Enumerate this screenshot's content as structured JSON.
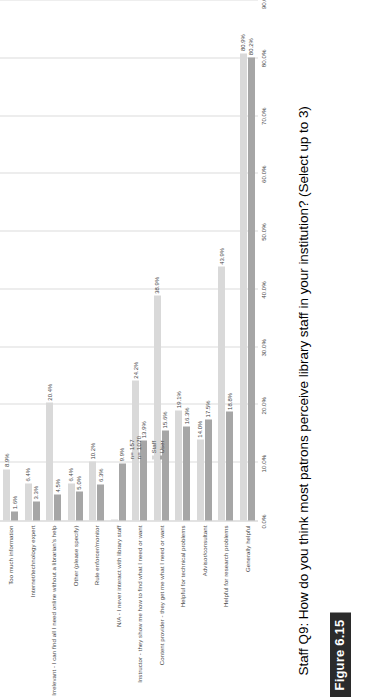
{
  "figure": {
    "badge_label": "Figure 6.15",
    "title": "Staff Q9: How do you think most patrons perceive library staff in your institution? (Select up to 3)"
  },
  "annotations": {
    "n_staff": "n= 157",
    "n_user": "n= 1070"
  },
  "colors": {
    "staff": "#d9d9d9",
    "user": "#a6a6a6",
    "grid": "#dcdcdc",
    "axis": "#c7c7c7",
    "text": "#4a4a4a",
    "badge_bg": "#2b2b2b"
  },
  "chart_data": {
    "type": "bar",
    "orientation": "vertical",
    "title": "Staff Q9: How do you think most patrons perceive library staff in your institution? (Select up to 3)",
    "xlabel": "",
    "ylabel": "",
    "ylim": [
      0,
      90
    ],
    "ytick_labels": [
      "0.0%",
      "10.0%",
      "20.0%",
      "30.0%",
      "40.0%",
      "50.0%",
      "60.0%",
      "70.0%",
      "80.0%",
      "90.0%"
    ],
    "ytick_values": [
      0,
      10,
      20,
      30,
      40,
      50,
      60,
      70,
      80,
      90
    ],
    "grid": true,
    "legend_position": "upper-right-inside",
    "categories": [
      "Too much information",
      "Internet/technology expert",
      "Irrelevant - I can find all I need online without a librarian's help",
      "Other (please specify)",
      "Rule enforcer/monitor",
      "N/A - I never interact with library staff",
      "Instructor - they show me how to find what I need or want",
      "Content provider - they get me what I need or want",
      "Helpful for technical problems",
      "Advisor/consultant",
      "Helpful for research problems",
      "Generally helpful"
    ],
    "series": [
      {
        "name": "Staff",
        "color": "#d9d9d9",
        "values": [
          8.9,
          6.4,
          20.4,
          6.4,
          10.2,
          0.0,
          24.2,
          38.9,
          19.1,
          14.0,
          43.9,
          80.9
        ],
        "labels": [
          "8.9%",
          "6.4%",
          "20.4%",
          "6.4%",
          "10.2%",
          "",
          "24.2%",
          "38.9%",
          "19.1%",
          "14.0%",
          "43.9%",
          "80.9%"
        ]
      },
      {
        "name": "User",
        "color": "#a6a6a6",
        "values": [
          1.6,
          3.3,
          4.5,
          5.0,
          6.3,
          9.9,
          13.9,
          15.6,
          16.3,
          17.5,
          18.8,
          80.2
        ],
        "labels": [
          "1.6%",
          "3.3%",
          "4.5%",
          "5.0%",
          "6.3%",
          "9.9%",
          "13.9%",
          "15.6%",
          "16.3%",
          "17.5%",
          "18.8%",
          "80.2%"
        ]
      }
    ],
    "legend": [
      "Staff",
      "User"
    ],
    "annotations": [
      "n= 157",
      "n= 1070"
    ]
  }
}
